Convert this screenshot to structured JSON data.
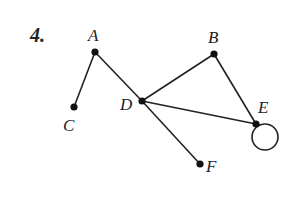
{
  "problem_number": "4.",
  "graph": {
    "nodes": [
      {
        "id": "A",
        "label": "A",
        "x": 95,
        "y": 52,
        "lx": 88,
        "ly": 41
      },
      {
        "id": "B",
        "label": "B",
        "x": 214,
        "y": 54,
        "lx": 208,
        "ly": 43
      },
      {
        "id": "C",
        "label": "C",
        "x": 74,
        "y": 107,
        "lx": 63,
        "ly": 131
      },
      {
        "id": "D",
        "label": "D",
        "x": 142,
        "y": 101,
        "lx": 120,
        "ly": 110
      },
      {
        "id": "E",
        "label": "E",
        "x": 256,
        "y": 124,
        "lx": 258,
        "ly": 113
      },
      {
        "id": "F",
        "label": "F",
        "x": 200,
        "y": 164,
        "lx": 206,
        "ly": 172
      }
    ],
    "edges": [
      {
        "from": "A",
        "to": "C"
      },
      {
        "from": "A",
        "to": "D"
      },
      {
        "from": "D",
        "to": "B"
      },
      {
        "from": "D",
        "to": "E"
      },
      {
        "from": "D",
        "to": "F"
      },
      {
        "from": "B",
        "to": "E"
      }
    ],
    "loops": [
      {
        "node": "E",
        "cx": 265,
        "cy": 137,
        "r": 13
      }
    ]
  }
}
